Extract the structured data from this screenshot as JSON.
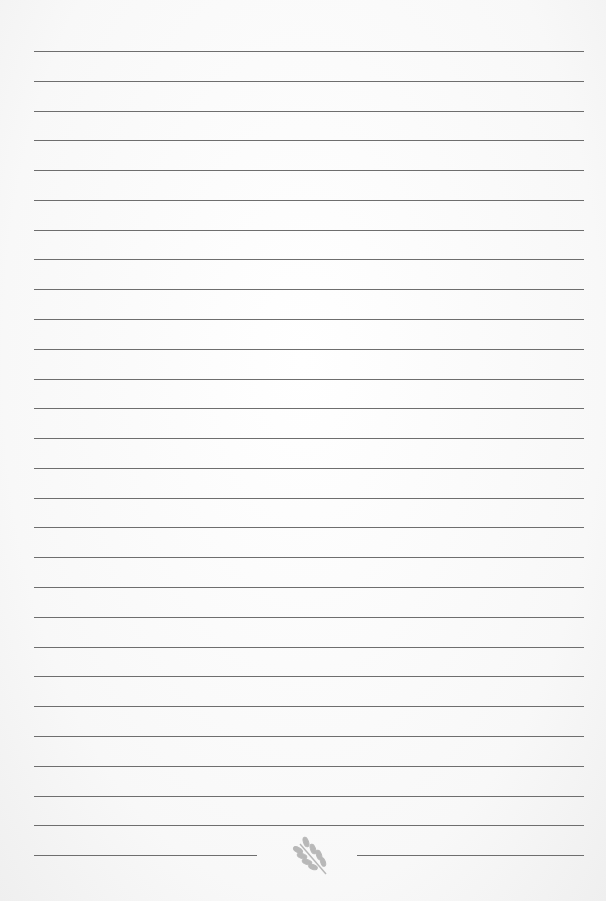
{
  "page": {
    "type": "lined-paper",
    "line_count": 28,
    "first_line_y": 51,
    "line_spacing": 29.78,
    "line_left": 34,
    "line_right": 584,
    "line_color": "#6e6e6e",
    "background_color": "#fafafa"
  },
  "footer": {
    "ornament": "leaf-icon",
    "ornament_color": "#b5b5b5"
  }
}
